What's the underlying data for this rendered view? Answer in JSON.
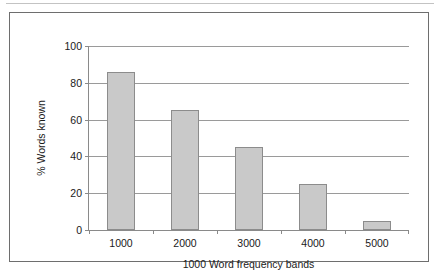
{
  "chart_data": {
    "type": "bar",
    "title": "",
    "categories": [
      "1000",
      "2000",
      "3000",
      "4000",
      "5000"
    ],
    "values": [
      86,
      65,
      45,
      25,
      5
    ],
    "xlabel": "1000 Word frequency bands",
    "ylabel": "% Words known",
    "ylim": [
      0,
      100
    ],
    "yticks": [
      0,
      20,
      40,
      60,
      80,
      100
    ],
    "ytick_labels": [
      "0",
      "20",
      "40",
      "60",
      "80",
      "100"
    ],
    "grid": "horizontal",
    "legend": "none",
    "bar_fill_color": "#c9c9c9",
    "bar_border_color": "#8c8c8c",
    "axis_color": "#8a8a8a",
    "grid_color": "#9a9a9a",
    "frame_color": "#6e6e6e",
    "text_color": "#1a1a1a"
  }
}
